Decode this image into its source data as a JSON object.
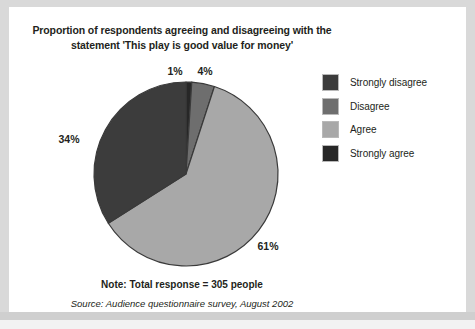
{
  "figure": {
    "title": "Proportion of respondents agreeing and disagreeing with the statement 'This play is good value for money'",
    "note": "Note: Total response = 305 people",
    "source": "Source: Audience questionnaire survey, August 2002"
  },
  "legend": {
    "items": [
      {
        "label": "Strongly disagree",
        "color": "#3c3c3c"
      },
      {
        "label": "Disagree",
        "color": "#6e6e6e"
      },
      {
        "label": "Agree",
        "color": "#a8a8a8"
      },
      {
        "label": "Strongly agree",
        "color": "#272727"
      }
    ]
  },
  "chart_data": {
    "type": "pie",
    "title": "Proportion of respondents agreeing and disagreeing with the statement 'This play is good value for money'",
    "note": "Note: Total response = 305 people",
    "source": "Source: Audience questionnaire survey, August 2002",
    "total_responses": 305,
    "units": "percent",
    "start_angle_deg": 0,
    "direction": "clockwise",
    "legend_position": "right",
    "categories": [
      "Strongly agree",
      "Disagree",
      "Agree",
      "Strongly disagree"
    ],
    "values": [
      1,
      4,
      61,
      34
    ],
    "labels": [
      "1%",
      "4%",
      "61%",
      "34%"
    ],
    "colors": [
      "#272727",
      "#6e6e6e",
      "#a8a8a8",
      "#3c3c3c"
    ],
    "slices": [
      {
        "name": "Strongly agree",
        "value": 1,
        "label": "1%",
        "color": "#272727"
      },
      {
        "name": "Disagree",
        "value": 4,
        "label": "4%",
        "color": "#6e6e6e"
      },
      {
        "name": "Agree",
        "value": 61,
        "label": "61%",
        "color": "#a8a8a8"
      },
      {
        "name": "Strongly disagree",
        "value": 34,
        "label": "34%",
        "color": "#3c3c3c"
      }
    ],
    "label_positions": [
      {
        "label": "1%",
        "x": 166,
        "y": 68
      },
      {
        "label": "4%",
        "x": 196,
        "y": 68
      },
      {
        "label": "61%",
        "x": 259,
        "y": 243
      },
      {
        "label": "34%",
        "x": 60,
        "y": 136
      }
    ],
    "geometry": {
      "cx": 177,
      "cy": 167,
      "r": 92,
      "stroke": "#3a3a3a",
      "stroke_width": 1.2
    }
  }
}
